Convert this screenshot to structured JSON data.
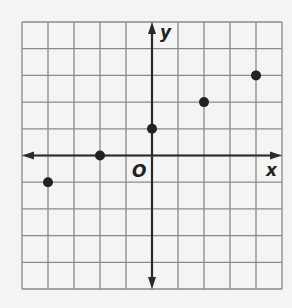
{
  "chart_data": {
    "type": "scatter",
    "title": "",
    "xlabel": "x",
    "ylabel": "y",
    "origin_label": "O",
    "xlim": [
      -5,
      5
    ],
    "ylim": [
      -5,
      5
    ],
    "grid": true,
    "points": [
      {
        "x": -4,
        "y": -1
      },
      {
        "x": -2,
        "y": 0
      },
      {
        "x": 0,
        "y": 1
      },
      {
        "x": 2,
        "y": 2
      },
      {
        "x": 4,
        "y": 3
      }
    ]
  },
  "colors": {
    "grid": "#8a8a8a",
    "axis": "#2a2a2a",
    "point": "#222222",
    "background": "#f4f4f4"
  }
}
